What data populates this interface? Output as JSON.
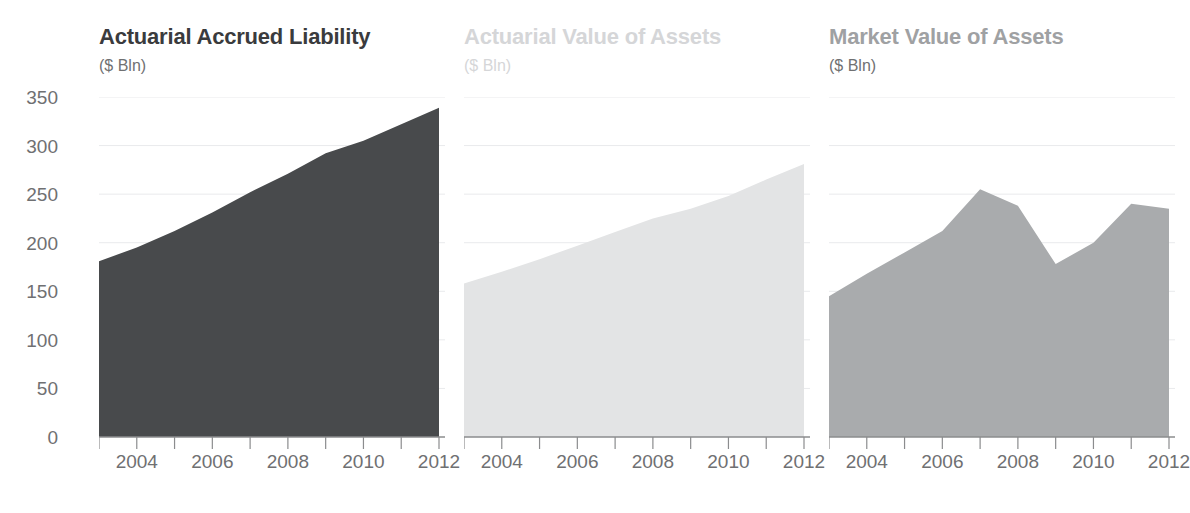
{
  "figure": {
    "background": "#ffffff",
    "axis_color": "#8b8c8e",
    "grid_color": "#e9eaec",
    "tick_text_color": "#6f7072",
    "y_axis_label_unit": "($ Bln)",
    "y_ticks": [
      0,
      50,
      100,
      150,
      200,
      250,
      300,
      350
    ],
    "y_tick_labels": [
      "0",
      "50",
      "100",
      "150",
      "200",
      "250",
      "300",
      "350"
    ],
    "x_tick_labels": [
      "2004",
      "2006",
      "2008",
      "2010",
      "2012"
    ],
    "x_tick_values": [
      2004,
      2006,
      2008,
      2010,
      2012
    ],
    "x_minor_ticks": [
      2003,
      2004,
      2005,
      2006,
      2007,
      2008,
      2009,
      2010,
      2011,
      2012
    ]
  },
  "chart_data": [
    {
      "type": "area",
      "title": "Actuarial Accrued Liability",
      "subtitle": "($ Bln)",
      "title_color": "#3a3b3d",
      "fill_color": "#484a4c",
      "xlabel": "",
      "ylabel": "($ Bln)",
      "xlim": [
        2003,
        2012
      ],
      "ylim": [
        0,
        350
      ],
      "grid": true,
      "x": [
        2003,
        2004,
        2005,
        2006,
        2007,
        2008,
        2009,
        2010,
        2011,
        2012
      ],
      "values": [
        181,
        195,
        212,
        231,
        252,
        271,
        292,
        305,
        322,
        339
      ]
    },
    {
      "type": "area",
      "title": "Actuarial Value of Assets",
      "subtitle": "($ Bln)",
      "title_color": "#d5d6d8",
      "fill_color": "#e3e4e5",
      "xlabel": "",
      "ylabel": "($ Bln)",
      "xlim": [
        2003,
        2012
      ],
      "ylim": [
        0,
        350
      ],
      "grid": true,
      "x": [
        2003,
        2004,
        2005,
        2006,
        2007,
        2008,
        2009,
        2010,
        2011,
        2012
      ],
      "values": [
        158,
        170,
        183,
        197,
        211,
        225,
        235,
        248,
        265,
        281
      ]
    },
    {
      "type": "area",
      "title": "Market Value of Assets",
      "subtitle": "($ Bln)",
      "title_color": "#9fa1a3",
      "fill_color": "#a9abad",
      "xlabel": "",
      "ylabel": "($ Bln)",
      "xlim": [
        2003,
        2012
      ],
      "ylim": [
        0,
        350
      ],
      "grid": true,
      "x": [
        2003,
        2004,
        2005,
        2006,
        2007,
        2008,
        2009,
        2010,
        2011,
        2012
      ],
      "values": [
        145,
        168,
        190,
        212,
        255,
        238,
        178,
        200,
        240,
        235
      ]
    }
  ]
}
